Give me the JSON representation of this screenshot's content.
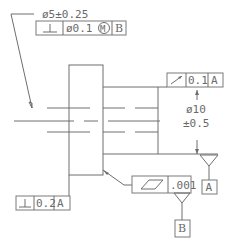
{
  "drawing": {
    "type": "GD&T mechanical drawing of stepped shaft",
    "top_dimension": {
      "text": "ø5±0.25"
    },
    "top_frame": {
      "symbol_name": "perpendicularity",
      "symbol": "⊥",
      "tolerance": "ø0.1",
      "modifier": "M",
      "datum": "B"
    },
    "runout_frame": {
      "symbol_name": "circular-runout",
      "symbol": "↗",
      "tolerance": "0.1",
      "datum": "A"
    },
    "diameter_dimension": {
      "line1": "ø10",
      "line2": "±0.5"
    },
    "bottom_left_frame": {
      "symbol_name": "perpendicularity",
      "symbol": "⊥",
      "tolerance": "0.2",
      "datum": "A"
    },
    "flatness_frame": {
      "symbol_name": "flatness",
      "tolerance": ".001"
    },
    "datum_a": {
      "label": "A"
    },
    "datum_b": {
      "label": "B"
    }
  }
}
